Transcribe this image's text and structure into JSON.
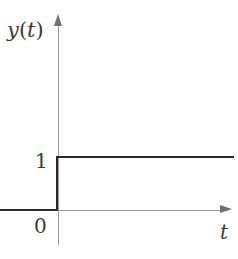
{
  "chart_data": {
    "type": "line",
    "title": "",
    "subtitle": "",
    "xlabel": "t",
    "ylabel": "y (t)",
    "xlim": [
      -1.05,
      3.2
    ],
    "ylim": [
      -0.35,
      1.75
    ],
    "grid": false,
    "legend": null,
    "x_tick_labels": [
      "0"
    ],
    "y_tick_labels": [
      "1"
    ],
    "origin_label": "0",
    "series": [
      {
        "name": "y(t)",
        "color": "#2b2b2b",
        "points": [
          {
            "x": -1.05,
            "y": 0
          },
          {
            "x": 0,
            "y": 0
          },
          {
            "x": 0,
            "y": 1
          },
          {
            "x": 3.2,
            "y": 1
          }
        ]
      }
    ],
    "annotations": [
      {
        "text": "y (t)",
        "role": "y-axis-label"
      },
      {
        "text": "t",
        "role": "x-axis-label"
      },
      {
        "text": "1",
        "role": "y-tick-label",
        "value": 1
      },
      {
        "text": "0",
        "role": "origin-label",
        "value": 0
      }
    ]
  },
  "figure": {
    "y_axis_label": {
      "variable": "y",
      "open_paren": "(",
      "argument": "t",
      "close_paren": ")"
    },
    "x_axis_label": "t",
    "tick_one": "1",
    "tick_zero": "0"
  },
  "colors": {
    "background": "#ffffff",
    "axis": "#9a9a9a",
    "arrow": "#6f6f6f",
    "curve": "#2b2b2b",
    "text": "#3a3a3a"
  }
}
